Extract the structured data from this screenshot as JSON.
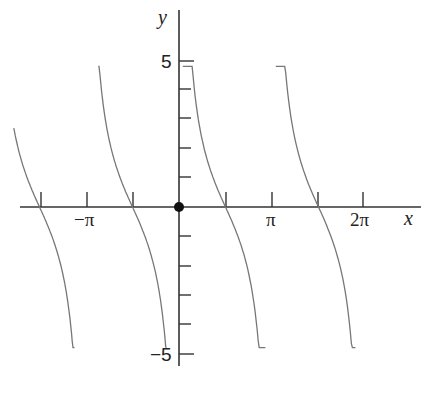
{
  "chart_data": {
    "type": "line",
    "title": "",
    "function": "y = k·cot(x)",
    "xlabel": "x",
    "ylabel": "y",
    "xlim": [
      -6.05,
      8.1
    ],
    "ylim": [
      -5.4,
      6.1
    ],
    "x_ticks": [
      {
        "value": -4.712,
        "label": ""
      },
      {
        "value": -3.1416,
        "label": "−π"
      },
      {
        "value": -1.5708,
        "label": ""
      },
      {
        "value": 1.5708,
        "label": ""
      },
      {
        "value": 3.1416,
        "label": "π"
      },
      {
        "value": 4.712,
        "label": ""
      },
      {
        "value": 6.2832,
        "label": "2π"
      }
    ],
    "y_ticks": [
      {
        "value": 5,
        "label": "5"
      },
      {
        "value": 4,
        "label": ""
      },
      {
        "value": 3,
        "label": ""
      },
      {
        "value": 2,
        "label": ""
      },
      {
        "value": 1,
        "label": ""
      },
      {
        "value": -1,
        "label": ""
      },
      {
        "value": -2,
        "label": ""
      },
      {
        "value": -3,
        "label": ""
      },
      {
        "value": -4,
        "label": ""
      },
      {
        "value": -5,
        "label": "−5"
      }
    ],
    "asymptotes": [
      -6.2832,
      -3.1416,
      0,
      3.1416,
      6.2832
    ],
    "zeros": [
      -4.712,
      -1.5708,
      1.5708,
      4.712
    ],
    "origin_point": {
      "x": 0,
      "y": 0
    },
    "branches": [
      {
        "x_range": [
          -5.58,
          -3.53
        ],
        "y_range": [
          2.35,
          -4.6
        ]
      },
      {
        "x_range": [
          -2.73,
          -0.42
        ],
        "y_range": [
          4.6,
          -4.5
        ]
      },
      {
        "x_range": [
          0.13,
          2.92
        ],
        "y_range": [
          4.6,
          -4.7
        ]
      },
      {
        "x_range": [
          3.27,
          5.96
        ],
        "y_range": [
          4.6,
          -4.7
        ]
      }
    ],
    "grid": false,
    "legend": null
  },
  "labels": {
    "x_axis": "x",
    "y_axis": "y",
    "y_five": "5",
    "y_neg_five": "−5",
    "x_neg_pi": "−π",
    "x_pi": "π",
    "x_two_pi": "2π"
  }
}
